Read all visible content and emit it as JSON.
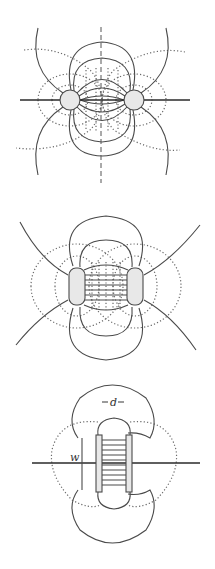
{
  "figure": {
    "panels": [
      {
        "id": "two-cylinders-far",
        "description": "Field lines (solid) and equipotentials (dotted) of two circular conductors separated by a large gap"
      },
      {
        "id": "two-rounded-conductors",
        "description": "Field lines and equipotentials for two rounded-rectangle conductors closer together"
      },
      {
        "id": "parallel-plates",
        "description": "Parallel plate capacitor with fringing field; plate separation d, plate width w",
        "labels": {
          "separation": "d",
          "width": "w"
        }
      }
    ],
    "colors": {
      "background": "#ffffff",
      "line": "#4a4a4a",
      "conductor_fill": "#e8e8e8"
    }
  }
}
